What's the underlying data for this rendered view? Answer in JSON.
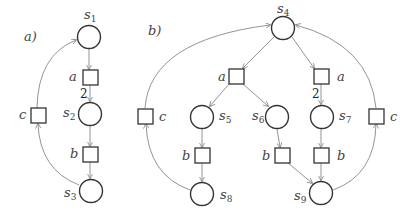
{
  "diagram": {
    "type": "petri-net",
    "colors": {
      "stroke": "#333333",
      "arc": "#888888",
      "text": "#444444"
    },
    "panels": [
      {
        "label": "a)",
        "places": [
          {
            "id": "s1",
            "name": "s",
            "sub": "1",
            "cx": 89,
            "cy": 37
          },
          {
            "id": "s2",
            "name": "s",
            "sub": "2",
            "cx": 90,
            "cy": 114
          },
          {
            "id": "s3",
            "name": "s",
            "sub": "3",
            "cx": 91,
            "cy": 191
          }
        ],
        "transitions": [
          {
            "id": "ta",
            "label": "a",
            "cx": 90,
            "cy": 77
          },
          {
            "id": "tb",
            "label": "b",
            "cx": 90,
            "cy": 154
          },
          {
            "id": "tc",
            "label": "c",
            "cx": 39,
            "cy": 116
          }
        ],
        "weights": [
          {
            "arc": "ta->s2",
            "value": "2"
          }
        ]
      },
      {
        "label": "b)",
        "places": [
          {
            "id": "s4",
            "name": "s",
            "sub": "4",
            "cx": 283,
            "cy": 28
          },
          {
            "id": "s5",
            "name": "s",
            "sub": "5",
            "cx": 202,
            "cy": 117
          },
          {
            "id": "s6",
            "name": "s",
            "sub": "6",
            "cx": 277,
            "cy": 117
          },
          {
            "id": "s7",
            "name": "s",
            "sub": "7",
            "cx": 322,
            "cy": 117
          },
          {
            "id": "s8",
            "name": "s",
            "sub": "8",
            "cx": 202,
            "cy": 194
          },
          {
            "id": "s9",
            "name": "s",
            "sub": "9",
            "cx": 321,
            "cy": 193
          }
        ],
        "transitions": [
          {
            "id": "ta1",
            "label": "a",
            "cx": 236,
            "cy": 76
          },
          {
            "id": "ta2",
            "label": "a",
            "cx": 321,
            "cy": 76
          },
          {
            "id": "tb1",
            "label": "b",
            "cx": 202,
            "cy": 155
          },
          {
            "id": "tb2",
            "label": "b",
            "cx": 282,
            "cy": 155
          },
          {
            "id": "tb3",
            "label": "b",
            "cx": 321,
            "cy": 155
          },
          {
            "id": "tc1",
            "label": "c",
            "cx": 145,
            "cy": 116
          },
          {
            "id": "tc2",
            "label": "c",
            "cx": 376,
            "cy": 116
          }
        ],
        "weights": [
          {
            "arc": "ta2->s7",
            "value": "2"
          }
        ]
      }
    ]
  },
  "labels": {
    "panel_a": "a)",
    "panel_b": "b)",
    "s": "s",
    "s1": "1",
    "s2": "2",
    "s3": "3",
    "s4": "4",
    "s5": "5",
    "s6": "6",
    "s7": "7",
    "s8": "8",
    "s9": "9",
    "a": "a",
    "b": "b",
    "c": "c",
    "w2": "2"
  }
}
